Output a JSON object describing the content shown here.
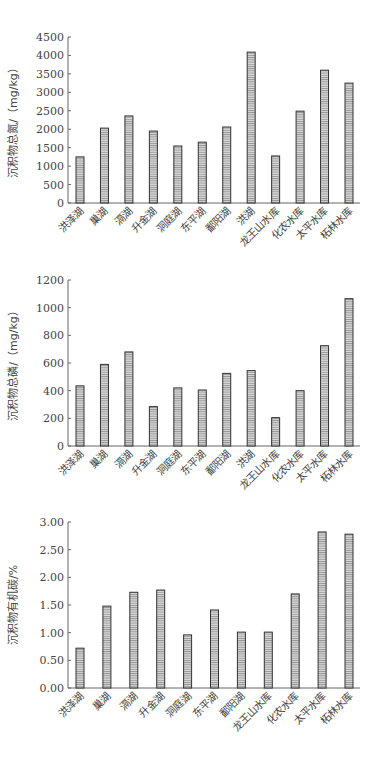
{
  "chart_data": [
    {
      "type": "bar",
      "title": "",
      "xlabel": "",
      "ylabel": "沉积物总氮/（mg/kg）",
      "ylim": [
        0,
        4500
      ],
      "yticks": [
        "0",
        "500",
        "1000",
        "1500",
        "2000",
        "2500",
        "3000",
        "3500",
        "4000",
        "4500"
      ],
      "grid": false,
      "categories": [
        "洪泽湖",
        "巢湖",
        "滆湖",
        "升金湖",
        "洞庭湖",
        "东平湖",
        "鄱阳湖",
        "洪湖",
        "龙王山水库",
        "化农水库",
        "太平水库",
        "柘林水库"
      ],
      "values": [
        1250,
        2030,
        2360,
        1950,
        1545,
        1650,
        2060,
        4090,
        1275,
        2490,
        3600,
        3250
      ]
    },
    {
      "type": "bar",
      "title": "",
      "xlabel": "",
      "ylabel": "沉积物总磷/（mg/kg）",
      "ylim": [
        0,
        1200
      ],
      "yticks": [
        "0",
        "200",
        "400",
        "600",
        "800",
        "1000",
        "1200"
      ],
      "grid": false,
      "categories": [
        "洪泽湖",
        "巢湖",
        "滆湖",
        "升金湖",
        "洞庭湖",
        "东平湖",
        "鄱阳湖",
        "洪湖",
        "龙王山水库",
        "化农水库",
        "太平水库",
        "柘林水库"
      ],
      "values": [
        435,
        590,
        680,
        285,
        420,
        405,
        525,
        545,
        205,
        400,
        725,
        1065
      ]
    },
    {
      "type": "bar",
      "title": "",
      "xlabel": "",
      "ylabel": "沉积物有机碳/%",
      "ylim": [
        0,
        3.0
      ],
      "yticks": [
        "0.00",
        "0.50",
        "1.00",
        "1.50",
        "2.00",
        "2.50",
        "3.00"
      ],
      "grid": false,
      "categories": [
        "洪泽湖",
        "巢湖",
        "滆湖",
        "升金湖",
        "洞庭湖",
        "东平湖",
        "鄱阳湖",
        "龙王山水库",
        "化农水库",
        "太平水库",
        "柘林水库"
      ],
      "values": [
        0.72,
        1.48,
        1.73,
        1.77,
        0.96,
        1.41,
        1.01,
        1.01,
        1.7,
        2.82,
        2.78
      ]
    }
  ],
  "style": {
    "bar_fill": "#d9d9d9",
    "bar_stroke": "#333333",
    "hatch_color": "#888888",
    "axis_color": "#666666"
  },
  "layout": [
    {
      "top": 0,
      "axis_y_top": 37,
      "axis_y_bottom": 203,
      "axis_x_left": 68,
      "axis_x_right": 360
    },
    {
      "top": 0,
      "axis_y_top": 280,
      "axis_y_bottom": 446,
      "axis_x_left": 68,
      "axis_x_right": 360
    },
    {
      "top": 0,
      "axis_y_top": 522,
      "axis_y_bottom": 688,
      "axis_x_left": 68,
      "axis_x_right": 360
    }
  ]
}
